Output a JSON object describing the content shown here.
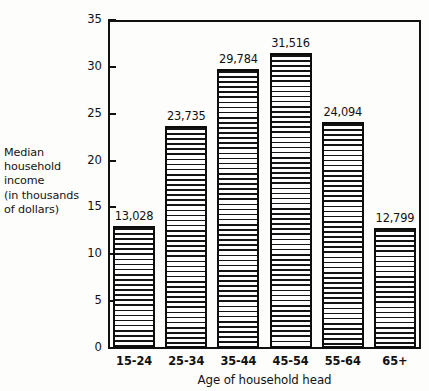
{
  "chart_data": {
    "type": "bar",
    "title": "",
    "categories": [
      "15-24",
      "25-34",
      "35-44",
      "45-54",
      "55-64",
      "65+"
    ],
    "values": [
      13.028,
      23.735,
      29.784,
      31.516,
      24.094,
      12.799
    ],
    "data_labels": [
      "13,028",
      "23,735",
      "29,784",
      "31,516",
      "24,094",
      "12,799"
    ],
    "xlabel": "Age of household head",
    "ylabel": "Median household income (in thousands of dollars)",
    "ylabel_lines": [
      "Median",
      "household",
      "income",
      "(in thousands",
      "of dollars)"
    ],
    "ylim": [
      0,
      35
    ],
    "yticks": [
      0,
      5,
      10,
      15,
      20,
      25,
      30,
      35
    ],
    "ytick_labels": [
      "0",
      "5",
      "10",
      "15",
      "20",
      "25",
      "30",
      "35"
    ],
    "grid": false,
    "legend": false,
    "bar_fill": "horizontal-line-hatch",
    "colors": {
      "axis": "#111111",
      "bar_edge": "#0d0d0d",
      "bar_hatch": "#141414",
      "bar_background": "#ffffff",
      "page_background": "#fdfdfc"
    }
  }
}
